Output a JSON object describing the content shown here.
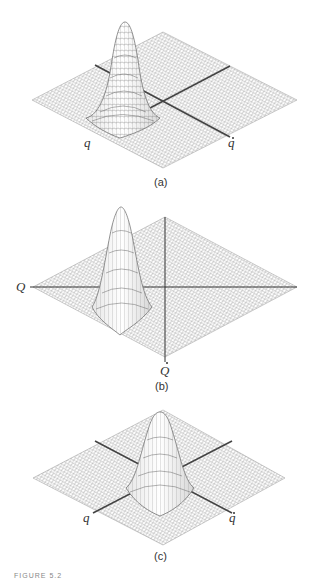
{
  "figure": {
    "caption_partial": "FIGURE 5.2",
    "panels": [
      {
        "id": "a",
        "label": "(a)",
        "axis_labels": {
          "left": "q",
          "right": "q"
        },
        "axis_label_dots": {
          "left": false,
          "right": true
        },
        "description": "Gaussian wave packet surface over phase plane, peak displaced along q axis"
      },
      {
        "id": "b",
        "label": "(b)",
        "axis_labels": {
          "left": "Q",
          "bottom": "Q"
        },
        "axis_label_dots": {
          "left": false,
          "bottom": true
        },
        "description": "Gaussian surface in rotated coordinates Q, Q-dot"
      },
      {
        "id": "c",
        "label": "(c)",
        "axis_labels": {
          "left": "q",
          "right": "q"
        },
        "axis_label_dots": {
          "left": false,
          "right": true
        },
        "description": "Gaussian surface centered at origin of phase plane"
      }
    ]
  },
  "colors": {
    "mesh": "#8a8a8a",
    "mesh_dark": "#555555",
    "axis": "#444444",
    "background": "#ffffff"
  }
}
